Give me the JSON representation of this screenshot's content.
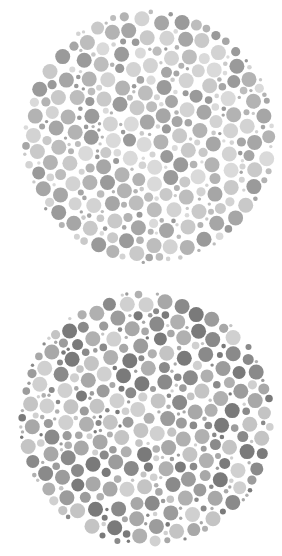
{
  "plates": [
    {
      "id": "plate-1",
      "kind": "color-vision-test-plate",
      "rendering": "grayscale",
      "palette": [
        "#c9c9c9",
        "#bdbdbd",
        "#b3b3b3",
        "#d3d3d3",
        "#a6a6a6",
        "#9a9a9a",
        "#dadada"
      ],
      "seed": 17
    },
    {
      "id": "plate-2",
      "kind": "color-vision-test-plate",
      "rendering": "grayscale",
      "palette": [
        "#c4c4c4",
        "#b0b0b0",
        "#9c9c9c",
        "#8a8a8a",
        "#7a7a7a",
        "#d0d0d0",
        "#a8a8a8"
      ],
      "seed": 53
    }
  ]
}
